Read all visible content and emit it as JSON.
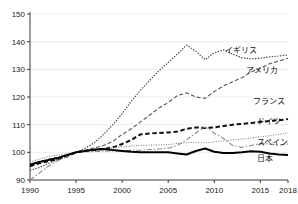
{
  "chart_data": {
    "type": "line",
    "title": "",
    "xlabel": "年",
    "ylabel": "",
    "xlim": [
      1990,
      2018
    ],
    "ylim": [
      90,
      150
    ],
    "yticks": [
      90,
      100,
      110,
      120,
      130,
      140,
      150
    ],
    "xticks": [
      1990,
      1995,
      2000,
      2005,
      2010,
      2015,
      2018
    ],
    "grid": true,
    "legend_position": "inline-right",
    "x": [
      1990,
      1991,
      1992,
      1993,
      1994,
      1995,
      1996,
      1997,
      1998,
      1999,
      2000,
      2001,
      2002,
      2003,
      2004,
      2005,
      2006,
      2007,
      2008,
      2009,
      2010,
      2011,
      2012,
      2013,
      2014,
      2015,
      2016,
      2017,
      2018
    ],
    "series": [
      {
        "name": "イギリス",
        "label": "イギリス",
        "color": "#3a3a3a",
        "style": "dotted",
        "width": 1.1,
        "label_x": 2011.2,
        "label_y": 137.0,
        "values": [
          93.5,
          94.5,
          96.0,
          97.5,
          98.8,
          100.0,
          101.5,
          103.5,
          106.5,
          110.0,
          114.0,
          118.5,
          122.5,
          126.0,
          129.5,
          132.5,
          135.5,
          138.8,
          136.5,
          133.5,
          136.0,
          137.0,
          135.5,
          134.2,
          133.8,
          134.0,
          134.5,
          134.8,
          135.2
        ]
      },
      {
        "name": "アメリカ",
        "label": "アメリカ",
        "color": "#555555",
        "style": "dashed",
        "width": 1.1,
        "label_x": 2013.4,
        "label_y": 129.8,
        "values": [
          95.5,
          96.5,
          97.5,
          98.2,
          99.0,
          100.0,
          100.8,
          101.6,
          102.5,
          104.0,
          106.5,
          108.5,
          111.0,
          113.5,
          116.0,
          118.0,
          120.5,
          121.5,
          120.0,
          119.5,
          122.0,
          124.0,
          125.5,
          127.0,
          129.0,
          130.5,
          132.0,
          133.0,
          134.0
        ]
      },
      {
        "name": "フランス",
        "label": "フランス",
        "color": "#111111",
        "style": "thick-dashed",
        "width": 2.0,
        "label_x": 2014.2,
        "label_y": 118.5,
        "values": [
          95.0,
          96.0,
          96.8,
          97.5,
          98.5,
          100.0,
          100.5,
          100.8,
          101.2,
          101.8,
          103.0,
          104.5,
          106.5,
          106.8,
          107.0,
          107.2,
          107.5,
          108.5,
          109.0,
          108.8,
          109.0,
          109.5,
          110.0,
          110.3,
          110.6,
          111.0,
          111.3,
          111.6,
          112.0
        ]
      },
      {
        "name": "ドイツ",
        "label": "ドイツ",
        "color": "#6a6a6a",
        "style": "fine-dotted",
        "width": 1.0,
        "label_x": 2014.6,
        "label_y": 111.2,
        "values": [
          96.5,
          97.5,
          98.5,
          99.0,
          99.5,
          100.0,
          100.4,
          100.8,
          101.2,
          101.6,
          102.0,
          102.3,
          102.5,
          102.6,
          102.7,
          102.8,
          103.2,
          103.5,
          103.6,
          103.4,
          103.8,
          104.2,
          104.5,
          104.8,
          105.2,
          105.6,
          106.0,
          106.5,
          107.0
        ]
      },
      {
        "name": "スペイン",
        "label": "スペイン",
        "color": "#8a8a8a",
        "style": "dash-dot",
        "width": 1.1,
        "label_x": 2014.6,
        "label_y": 103.8,
        "values": [
          90.0,
          92.5,
          95.0,
          97.0,
          98.5,
          100.0,
          100.2,
          100.3,
          100.4,
          100.5,
          100.6,
          100.7,
          100.8,
          101.0,
          101.2,
          101.5,
          102.5,
          104.5,
          107.0,
          109.2,
          107.0,
          105.0,
          102.5,
          101.8,
          102.5,
          103.2,
          103.0,
          102.6,
          103.0
        ]
      },
      {
        "name": "日本",
        "label": "日本",
        "color": "#000000",
        "style": "solid",
        "width": 2.0,
        "label_x": 2014.6,
        "label_y": 97.8,
        "values": [
          95.5,
          96.5,
          97.2,
          98.0,
          99.0,
          100.0,
          100.5,
          101.0,
          101.2,
          100.8,
          100.5,
          100.2,
          100.0,
          100.0,
          100.0,
          100.0,
          99.6,
          99.2,
          100.5,
          101.4,
          100.2,
          99.8,
          99.8,
          100.0,
          100.4,
          100.2,
          99.6,
          99.2,
          99.0
        ]
      }
    ]
  }
}
